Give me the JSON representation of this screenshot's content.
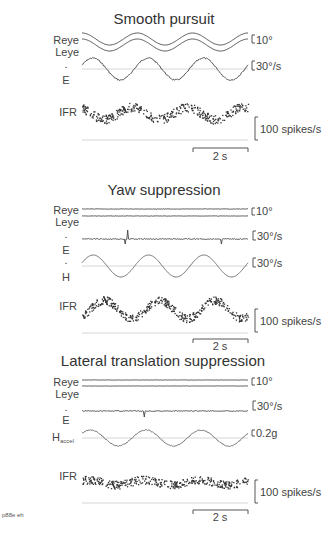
{
  "panels": [
    {
      "id": "smooth-pursuit",
      "title": "Smooth pursuit",
      "labels": {
        "reye": "Reye",
        "leye": "Leye",
        "e": "E",
        "e_dot": ".",
        "ifr": "IFR"
      },
      "scales": {
        "position": "10°",
        "eye_velocity": "30°/s",
        "ifr": "100 spikes/s",
        "time": "2 s"
      }
    },
    {
      "id": "yaw-suppression",
      "title": "Yaw suppression",
      "labels": {
        "reye": "Reye",
        "leye": "Leye",
        "e": "E",
        "e_dot": ".",
        "h": "H",
        "h_dot": ".",
        "ifr": "IFR"
      },
      "scales": {
        "position": "10°",
        "eye_velocity": "30°/s",
        "head_velocity": "30°/s",
        "ifr": "100 spikes/s",
        "time": "2 s"
      }
    },
    {
      "id": "lateral-translation-suppression",
      "title": "Lateral translation suppression",
      "labels": {
        "reye": "Reye",
        "leye": "Leye",
        "e": "E",
        "e_dot": ".",
        "h": "H",
        "h_sub": "accel",
        "ifr": "IFR"
      },
      "scales": {
        "position": "10°",
        "eye_velocity": "30°/s",
        "head_accel": "0.2g",
        "ifr": "100 spikes/s",
        "time": "2 s"
      }
    }
  ],
  "footer": {
    "id_label": "p88e eh"
  },
  "chart_data": [
    {
      "type": "line",
      "title": "Smooth pursuit",
      "series": [
        {
          "name": "Reye",
          "shape": "sinusoid",
          "cycles": 3,
          "amplitude_deg": 5
        },
        {
          "name": "Leye",
          "shape": "sinusoid",
          "cycles": 3,
          "amplitude_deg": 5
        },
        {
          "name": "Eye velocity (E dot)",
          "shape": "sinusoid",
          "cycles": 3,
          "amplitude_deg_per_s": 30
        },
        {
          "name": "IFR",
          "shape": "scatter modulated sinusoidally",
          "range_spikes_per_s": [
            100,
            200
          ]
        }
      ],
      "scale_bars": [
        "10°",
        "30°/s",
        "100 spikes/s",
        "2 s"
      ],
      "duration_s": 6
    },
    {
      "type": "line",
      "title": "Yaw suppression",
      "series": [
        {
          "name": "Reye",
          "shape": "flat"
        },
        {
          "name": "Leye",
          "shape": "flat"
        },
        {
          "name": "Eye velocity (E dot)",
          "shape": "flat with saccade transients"
        },
        {
          "name": "Head velocity (H dot)",
          "shape": "sinusoid",
          "cycles": 3,
          "amplitude_deg_per_s": 30
        },
        {
          "name": "IFR",
          "shape": "scatter modulated sinusoidally",
          "range_spikes_per_s": [
            100,
            220
          ]
        }
      ],
      "scale_bars": [
        "10°",
        "30°/s",
        "30°/s",
        "100 spikes/s",
        "2 s"
      ],
      "duration_s": 6
    },
    {
      "type": "line",
      "title": "Lateral translation suppression",
      "series": [
        {
          "name": "Reye",
          "shape": "flat"
        },
        {
          "name": "Leye",
          "shape": "flat"
        },
        {
          "name": "Eye velocity (E dot)",
          "shape": "flat with one transient"
        },
        {
          "name": "H accel",
          "shape": "sinusoid",
          "cycles": 3,
          "amplitude_g": 0.1
        },
        {
          "name": "IFR",
          "shape": "scatter weakly modulated",
          "range_spikes_per_s": [
            150,
            190
          ]
        }
      ],
      "scale_bars": [
        "10°",
        "30°/s",
        "0.2g",
        "100 spikes/s",
        "2 s"
      ],
      "duration_s": 6
    }
  ]
}
